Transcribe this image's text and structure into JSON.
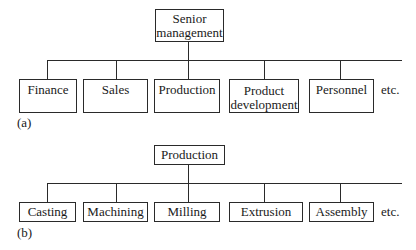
{
  "diagram_a": {
    "label": "(a)",
    "root": "Senior management",
    "root_lines": [
      "Senior",
      "management"
    ],
    "children": [
      {
        "lines": [
          "Finance",
          ""
        ]
      },
      {
        "lines": [
          "Sales",
          ""
        ]
      },
      {
        "lines": [
          "Production",
          ""
        ]
      },
      {
        "lines": [
          "Product",
          "development"
        ]
      },
      {
        "lines": [
          "Personnel",
          ""
        ]
      }
    ],
    "continuation": "etc."
  },
  "diagram_b": {
    "label": "(b)",
    "root": "Production",
    "children": [
      "Casting",
      "Machining",
      "Milling",
      "Extrusion",
      "Assembly"
    ],
    "continuation": "etc."
  }
}
